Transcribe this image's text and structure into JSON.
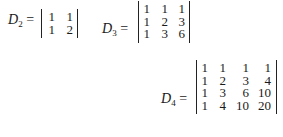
{
  "determinants": [
    {
      "name": "D",
      "subscript": "2",
      "equals": "=",
      "rows": [
        [
          "1",
          "1"
        ],
        [
          "1",
          "2"
        ]
      ]
    },
    {
      "name": "D",
      "subscript": "3",
      "equals": "=",
      "rows": [
        [
          "1",
          "1",
          "1"
        ],
        [
          "1",
          "2",
          "3"
        ],
        [
          "1",
          "3",
          "6"
        ]
      ]
    },
    {
      "name": "D",
      "subscript": "4",
      "equals": "=",
      "rows": [
        [
          "1",
          "1",
          "1",
          "1"
        ],
        [
          "1",
          "2",
          "3",
          "4"
        ],
        [
          "1",
          "3",
          "6",
          "10"
        ],
        [
          "1",
          "4",
          "10",
          "20"
        ]
      ]
    }
  ]
}
